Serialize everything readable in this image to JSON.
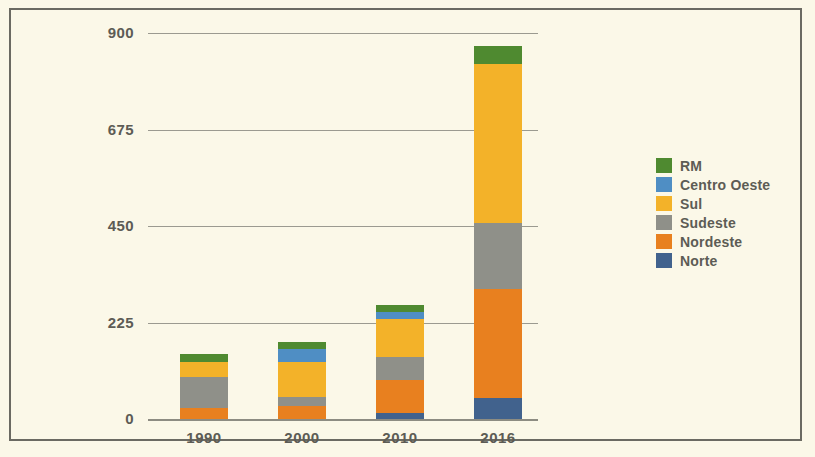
{
  "chart_data": {
    "type": "bar",
    "stacked": true,
    "title": "",
    "xlabel": "",
    "ylabel": "Número de municípios metropolitanos",
    "ylabel_line1": "Número de municípios",
    "ylabel_line2": "metropolitanos",
    "categories": [
      "1990",
      "2000",
      "2010",
      "2016"
    ],
    "ylim": [
      0,
      900
    ],
    "yticks": [
      0,
      225,
      450,
      675,
      900
    ],
    "ytick_labels": [
      "0",
      "225",
      "450",
      "675",
      "900"
    ],
    "grid": true,
    "legend_position": "right",
    "series": [
      {
        "name": "Norte",
        "color": "#41628d",
        "values": [
          0,
          0,
          14,
          49
        ]
      },
      {
        "name": "Nordeste",
        "color": "#e8801f",
        "values": [
          26,
          30,
          77,
          254
        ]
      },
      {
        "name": "Sudeste",
        "color": "#8f9089",
        "values": [
          72,
          21,
          54,
          153
        ]
      },
      {
        "name": "Sul",
        "color": "#f3b229",
        "values": [
          35,
          82,
          89,
          372
        ]
      },
      {
        "name": "Centro Oeste",
        "color": "#4f8ec4",
        "values": [
          0,
          30,
          16,
          0
        ]
      },
      {
        "name": "RM",
        "color": "#4f8a30",
        "values": [
          19,
          16,
          16,
          42
        ]
      }
    ],
    "stack_order_bottom_to_top": [
      "Norte",
      "Nordeste",
      "Sudeste",
      "Sul",
      "Centro Oeste",
      "RM"
    ],
    "totals": [
      152,
      179,
      266,
      870
    ]
  },
  "legend": {
    "entries": [
      {
        "label": "RM",
        "color": "#4f8a30"
      },
      {
        "label": "Centro Oeste",
        "color": "#4f8ec4"
      },
      {
        "label": "Sul",
        "color": "#f3b229"
      },
      {
        "label": "Sudeste",
        "color": "#8f9089"
      },
      {
        "label": "Nordeste",
        "color": "#e8801f"
      },
      {
        "label": "Norte",
        "color": "#41628d"
      }
    ]
  },
  "colors": {
    "background": "#fbf8e8",
    "border": "#6b6a62",
    "gridline": "#9b9a90",
    "text": "#5d5c55"
  }
}
